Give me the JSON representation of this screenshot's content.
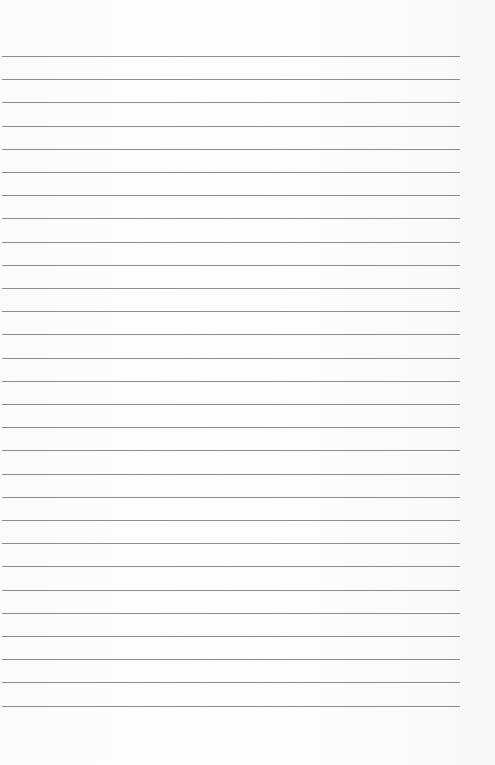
{
  "page": {
    "type": "lined-paper",
    "background_color": "#fcfcfc",
    "line_color": "#8c8c8c",
    "line_count": 29,
    "first_line_y": 56,
    "line_spacing": 23.2,
    "line_left": 2,
    "line_width": 458,
    "text_content": []
  }
}
